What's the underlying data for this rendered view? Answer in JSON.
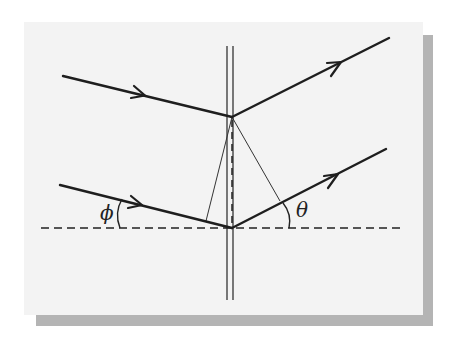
{
  "diagram": {
    "type": "thin-film-reflection",
    "colors": {
      "card_bg": "#f3f3f3",
      "shadow": "#b4b4b4",
      "ray": "#1e1e1e",
      "thin_line": "#333333"
    },
    "labels": {
      "angle_incident": "ϕ",
      "angle_reflected": "θ"
    },
    "elements": {
      "slab": {
        "x1": 227,
        "x2": 233,
        "y_top": 46,
        "y_bottom": 300
      },
      "upper_vertex": [
        232,
        117
      ],
      "lower_vertex": [
        232,
        228
      ],
      "incident_ray_upper": {
        "from": [
          63,
          76
        ],
        "to": [
          232,
          117
        ]
      },
      "reflected_ray_upper": {
        "from": [
          232,
          117
        ],
        "to": [
          389,
          38
        ]
      },
      "incident_ray_lower": {
        "from": [
          60,
          185
        ],
        "to": [
          232,
          228
        ]
      },
      "reflected_ray_lower": {
        "from": [
          232,
          228
        ],
        "to": [
          386,
          149
        ]
      },
      "baseline_dashed": {
        "x1": 41,
        "x2": 404,
        "y": 228
      },
      "normal_dashed": {
        "x": 232,
        "y1": 117,
        "y2": 228
      },
      "construction_left": {
        "from": [
          232,
          117
        ],
        "to": [
          206,
          221
        ]
      },
      "construction_right": {
        "from": [
          232,
          117
        ],
        "to": [
          280,
          201
        ]
      }
    }
  }
}
